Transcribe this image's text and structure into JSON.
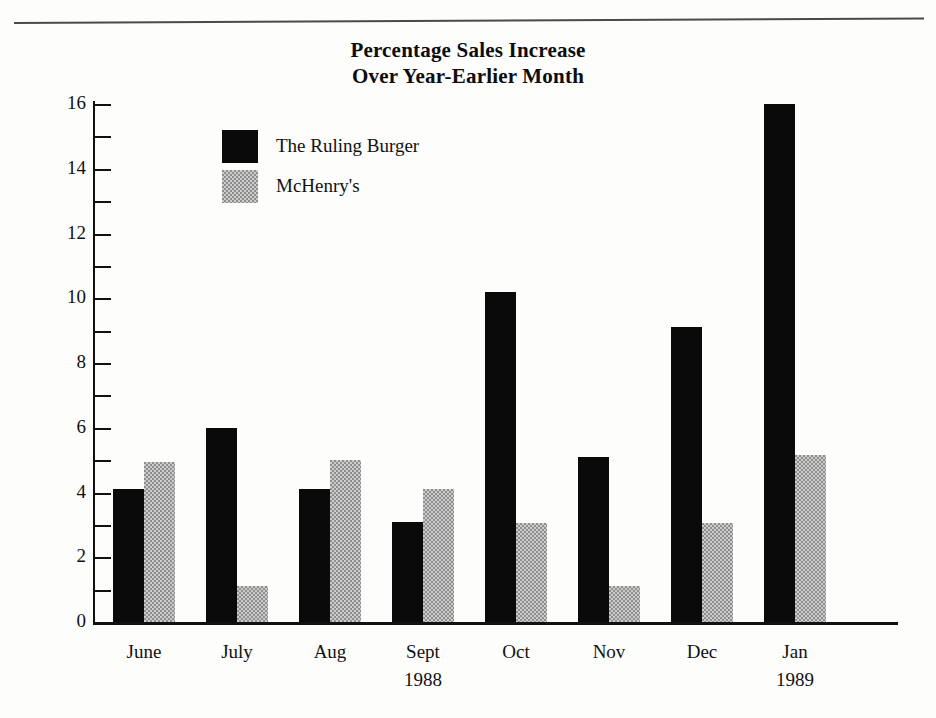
{
  "document": {
    "top_rule": "horizontal-rule"
  },
  "chart_data": {
    "type": "bar",
    "title": "Percentage Sales Increase Over Year-Earlier Month",
    "title_lines": [
      "Percentage Sales Increase",
      "Over Year-Earlier Month"
    ],
    "xlabel": "",
    "ylabel": "",
    "ylim": [
      0,
      16
    ],
    "grid": false,
    "legend_position": "upper-left-inside",
    "y_major_ticks": [
      0,
      2,
      4,
      6,
      8,
      10,
      12,
      14,
      16
    ],
    "y_minor_ticks": [
      1,
      3,
      5,
      7,
      9,
      11,
      13,
      15
    ],
    "y_tick_labels": [
      "0",
      "2",
      "4",
      "6",
      "8",
      "10",
      "12",
      "14",
      "16"
    ],
    "categories": [
      "June",
      "July",
      "Aug",
      "Sept",
      "Oct",
      "Nov",
      "Dec",
      "Jan"
    ],
    "category_sublabels": [
      "",
      "",
      "",
      "1988",
      "",
      "",
      "",
      "1989"
    ],
    "series": [
      {
        "name": "The Ruling Burger",
        "color": "#0a0a0a",
        "values": [
          4.1,
          6.0,
          4.1,
          3.1,
          10.2,
          5.1,
          9.1,
          16.0
        ]
      },
      {
        "name": "McHenry's",
        "color": "#8e8e8e",
        "values": [
          4.95,
          1.1,
          5.0,
          4.1,
          3.05,
          1.1,
          3.05,
          5.15
        ]
      }
    ]
  },
  "colors": {
    "series_black": "#0a0a0a",
    "series_gray": "#8e8e8e",
    "axis": "#111111",
    "background": "#fdfdfc"
  }
}
